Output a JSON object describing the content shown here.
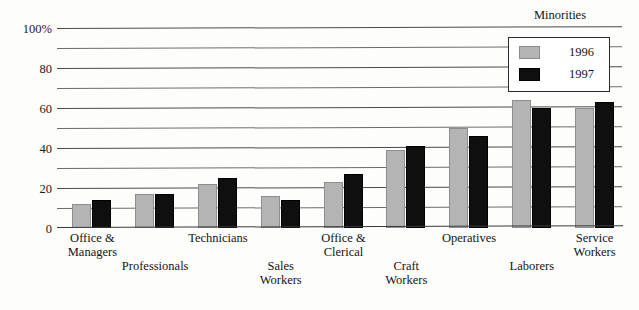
{
  "chart_data": {
    "type": "bar",
    "title": "",
    "xlabel": "",
    "ylabel": "",
    "ylim": [
      0,
      100
    ],
    "grid": true,
    "legend_position": "top-right",
    "legend_title": "Minorities",
    "y_ticks": [
      "0",
      "20",
      "40",
      "60",
      "80",
      "100%"
    ],
    "y_tick_values": [
      0,
      20,
      40,
      60,
      80,
      100
    ],
    "y_minor_gridlines": [
      10,
      30,
      50,
      70,
      90
    ],
    "categories": [
      "Office & Managers",
      "Professionals",
      "Technicians",
      "Sales Workers",
      "Office & Clerical",
      "Craft Workers",
      "Operatives",
      "Laborers",
      "Service Workers"
    ],
    "category_lines": [
      [
        "Office &",
        "Managers"
      ],
      [
        "Professionals"
      ],
      [
        "Technicians"
      ],
      [
        "Sales",
        "Workers"
      ],
      [
        "Office &",
        "Clerical"
      ],
      [
        "Craft",
        "Workers"
      ],
      [
        "Operatives"
      ],
      [
        "Laborers"
      ],
      [
        "Service",
        "Workers"
      ]
    ],
    "series": [
      {
        "name": "1996",
        "color": "#b4b4b4",
        "values": [
          12,
          17,
          22,
          16,
          23,
          39,
          50,
          64,
          60
        ]
      },
      {
        "name": "1997",
        "color": "#0f0f0f",
        "values": [
          14,
          17,
          25,
          14,
          27,
          41,
          46,
          60,
          63
        ]
      }
    ]
  },
  "legend": {
    "title": "Minorities",
    "entries": [
      {
        "label": "1996",
        "swatch": "gray-swatch"
      },
      {
        "label": "1997",
        "swatch": "black-swatch"
      }
    ]
  },
  "axis": {
    "y_labels": [
      "100%",
      "80",
      "60",
      "40",
      "20",
      "0"
    ]
  }
}
